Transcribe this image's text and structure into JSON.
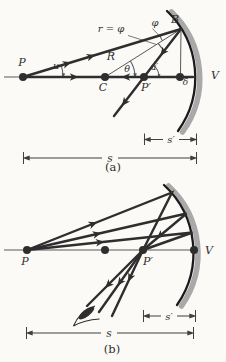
{
  "colors": {
    "background": "#fbfaf7",
    "ink": "#2e2e2e",
    "thin": "#585858",
    "mirror_band": "#a9a9a9",
    "mirror_edge": "#1a1a1a",
    "dimension": "#3f3f3f"
  },
  "panel_a": {
    "caption": "(a)",
    "labels": {
      "P": "P",
      "u": "u",
      "reflection_note": "r = φ",
      "phi": "φ",
      "B": "B",
      "R": "R",
      "theta": "θ",
      "u_prime": "u′",
      "C": "C",
      "P_prime": "P′",
      "delta": "δ",
      "V": "V",
      "s_prime": "s′",
      "s": "s"
    }
  },
  "panel_b": {
    "caption": "(b)",
    "labels": {
      "P": "P",
      "P_prime": "P′",
      "V": "V",
      "s_prime": "s′",
      "s": "s"
    }
  }
}
